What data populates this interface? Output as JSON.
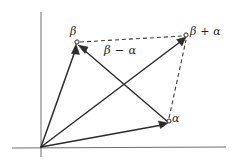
{
  "figure": {
    "background_color": "#ffffff",
    "line_color": "#2b2b2b",
    "axis_color": "#6e6e6e",
    "width": 237,
    "height": 165
  },
  "labels": {
    "beta": "β",
    "alpha": "α",
    "beta_plus_alpha": "β + α",
    "beta_minus_alpha": "β − α"
  },
  "axes": {
    "x_axis": {
      "x1": 12,
      "y1": 148,
      "x2": 226,
      "y2": 147
    },
    "y_axis": {
      "x1": 41,
      "y1": 12,
      "x2": 41,
      "y2": 157
    }
  },
  "points": {
    "origin": {
      "x": 41,
      "y": 147
    },
    "beta": {
      "x": 76,
      "y": 44
    },
    "alpha": {
      "x": 168,
      "y": 122
    },
    "beta_plus_alpha": {
      "x": 186,
      "y": 36
    }
  },
  "edges": [
    {
      "name": "origin-to-beta",
      "style": "solid",
      "arrow": true
    },
    {
      "name": "origin-to-alpha",
      "style": "solid",
      "arrow": true
    },
    {
      "name": "origin-to-beta-plus-alpha",
      "style": "solid",
      "arrow": true
    },
    {
      "name": "alpha-to-beta",
      "style": "solid",
      "arrow": true
    },
    {
      "name": "beta-to-beta-plus-alpha",
      "style": "dashed",
      "arrow": false
    },
    {
      "name": "alpha-to-beta-plus-alpha",
      "style": "dashed",
      "arrow": false
    }
  ]
}
